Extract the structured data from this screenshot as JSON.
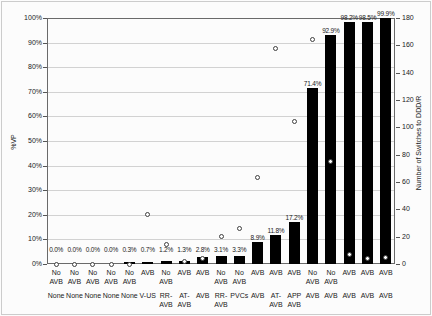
{
  "figure": {
    "left_axis_title": "%VP",
    "right_axis_title": "Number of Switches to DDD/R"
  },
  "chart_data": {
    "type": "bar",
    "subtype": "bar-with-scatter-overlay",
    "title": "",
    "xlabel": "",
    "ylabel_left": "%VP",
    "ylabel_right": "Number of Switches to DDD/R",
    "grid": true,
    "legend": "none",
    "left_axis": {
      "range": [
        0,
        100
      ],
      "ticks": [
        "0%",
        "10%",
        "20%",
        "30%",
        "40%",
        "50%",
        "60%",
        "70%",
        "80%",
        "90%",
        "100%"
      ]
    },
    "right_axis": {
      "range": [
        0,
        180
      ],
      "ticks": [
        "0",
        "20",
        "40",
        "60",
        "80",
        "100",
        "120",
        "140",
        "160",
        "180"
      ]
    },
    "categories_row1": [
      "No\nAVB",
      "No\nAVB",
      "No\nAVB",
      "No\nAVB",
      "No\nAVB",
      "AVB",
      "No\nAVB",
      "AVB",
      "AVB",
      "No\nAVB",
      "No\nAVB",
      "AVB",
      "AVB",
      "AVB",
      "No\nAVB",
      "No\nAVB",
      "AVB",
      "AVB",
      "AVB"
    ],
    "categories_row2": [
      "None",
      "None",
      "None",
      "None",
      "None",
      "V-US",
      "RR-\nAVB",
      "AT-\nAVB",
      "AVB",
      "RR-\nAVB",
      "PVCs",
      "AVB",
      "AT-\nAVB",
      "APP\nAVB",
      "AVB",
      "AVB",
      "AVB",
      "AVB",
      "AVB"
    ],
    "series": [
      {
        "name": "%VP",
        "type": "bar",
        "axis": "left",
        "color": "#000000",
        "values": [
          0.0,
          0.0,
          0.0,
          0.0,
          0.3,
          0.7,
          1.2,
          1.3,
          2.8,
          3.1,
          3.3,
          8.9,
          11.8,
          17.2,
          71.4,
          92.9,
          98.2,
          98.5,
          99.9
        ],
        "labels": [
          "0.0%",
          "0.0%",
          "0.0%",
          "0.0%",
          "0.3%",
          "0.7%",
          "1.2%",
          "1.3%",
          "2.8%",
          "3.1%",
          "3.3%",
          "8.9%",
          "11.8%",
          "17.2%",
          "71.4%",
          "92.9%",
          "98.2%",
          "98.5%",
          "99.9%"
        ]
      },
      {
        "name": "Number of Switches to DDD/R",
        "type": "scatter",
        "marker": "open-circle",
        "axis": "right",
        "fill": "#ffffff",
        "stroke": "#3f3f3f",
        "values": [
          0,
          0,
          0,
          0,
          0,
          36,
          14,
          2,
          4,
          20,
          26,
          63,
          158,
          104,
          164,
          75,
          7,
          4,
          5
        ]
      }
    ]
  },
  "colors": {
    "bar": "#000000",
    "grid": "#d2d2d2",
    "frame": "#6a6a6a",
    "text": "#1a1a1a",
    "background": "#fcfcfc",
    "marker_fill": "#ffffff",
    "marker_stroke": "#3f3f3f"
  }
}
